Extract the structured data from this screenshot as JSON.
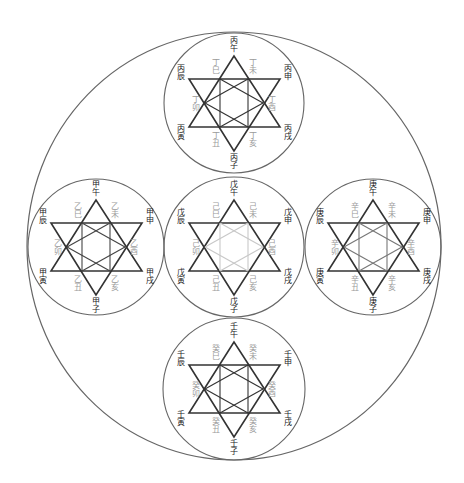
{
  "diagram": {
    "outer_circle": {
      "cx": 234,
      "cy": 246,
      "rx": 207,
      "ry": 214,
      "stroke": "#666666"
    },
    "colors": {
      "circle_stroke": "#666666",
      "star_stroke": "#333333",
      "outer_label": "#222222",
      "inner_label": "#9a9a9a"
    },
    "groups": [
      {
        "id": "bing-ding",
        "position": "top",
        "cx": 234,
        "cy": 103,
        "r": 70,
        "inner_line_color": "#333333",
        "outer_labels": {
          "top": "丙午",
          "upper_left": "丙辰",
          "upper_right": "丙申",
          "lower_left": "丙寅",
          "lower_right": "丙戌",
          "bottom": "丙子"
        },
        "inner_labels": {
          "upper_left": "丁巳",
          "upper_right": "丁未",
          "left": "丁卯",
          "right": "丁酉",
          "lower_left": "丁丑",
          "lower_right": "丁亥"
        }
      },
      {
        "id": "jia-yi",
        "position": "left",
        "cx": 96,
        "cy": 247,
        "r": 68,
        "inner_line_color": "#444444",
        "outer_labels": {
          "top": "甲午",
          "upper_left": "甲辰",
          "upper_right": "甲申",
          "lower_left": "甲寅",
          "lower_right": "甲戌",
          "bottom": "甲子"
        },
        "inner_labels": {
          "upper_left": "乙巳",
          "upper_right": "乙未",
          "left": "乙卯",
          "right": "乙酉",
          "lower_left": "乙丑",
          "lower_right": "乙亥"
        }
      },
      {
        "id": "wu-ji",
        "position": "center",
        "cx": 234,
        "cy": 247,
        "r": 70,
        "inner_line_color": "#c8c8c8",
        "outer_labels": {
          "top": "戊午",
          "upper_left": "戊辰",
          "upper_right": "戊申",
          "lower_left": "戊寅",
          "lower_right": "戊戌",
          "bottom": "戊子"
        },
        "inner_labels": {
          "upper_left": "己巳",
          "upper_right": "己未",
          "left": "己卯",
          "right": "己酉",
          "lower_left": "己丑",
          "lower_right": "己亥"
        }
      },
      {
        "id": "geng-xin",
        "position": "right",
        "cx": 373,
        "cy": 247,
        "r": 68,
        "inner_line_color": "#777777",
        "outer_labels": {
          "top": "庚午",
          "upper_left": "庚辰",
          "upper_right": "庚申",
          "lower_left": "庚寅",
          "lower_right": "庚戌",
          "bottom": "庚子"
        },
        "inner_labels": {
          "upper_left": "辛巳",
          "upper_right": "辛未",
          "left": "辛卯",
          "right": "辛酉",
          "lower_left": "辛丑",
          "lower_right": "辛亥"
        }
      },
      {
        "id": "ren-gui",
        "position": "bottom",
        "cx": 234,
        "cy": 389,
        "r": 71,
        "inner_line_color": "#333333",
        "outer_labels": {
          "top": "壬午",
          "upper_left": "壬辰",
          "upper_right": "壬申",
          "lower_left": "壬寅",
          "lower_right": "壬戌",
          "bottom": "壬子"
        },
        "inner_labels": {
          "upper_left": "癸巳",
          "upper_right": "癸未",
          "left": "癸卯",
          "right": "癸酉",
          "lower_left": "癸丑",
          "lower_right": "癸亥"
        }
      }
    ]
  }
}
